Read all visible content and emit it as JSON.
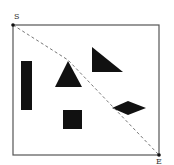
{
  "diagram": {
    "type": "path-planning-obstacle-map",
    "colors": {
      "background": "#ffffff",
      "border": "#555555",
      "obstacle": "#111111",
      "path": "#777777",
      "label": "#333333"
    },
    "start": {
      "label": "S",
      "x": 13,
      "y": 25
    },
    "end": {
      "label": "E",
      "x": 159,
      "y": 155
    },
    "border": {
      "x": 13,
      "y": 25,
      "width": 146,
      "height": 130
    },
    "path_points": [
      [
        13,
        25
      ],
      [
        68,
        60
      ],
      [
        159,
        155
      ]
    ],
    "obstacles": [
      {
        "name": "vertical-bar",
        "shape": "rect",
        "x": 21,
        "y": 61,
        "width": 11,
        "height": 49
      },
      {
        "name": "upright-triangle",
        "shape": "polygon",
        "points": "68,61 55,87 82,87"
      },
      {
        "name": "right-triangle",
        "shape": "polygon",
        "points": "92,47 92,72 123,72"
      },
      {
        "name": "square",
        "shape": "rect",
        "x": 63,
        "y": 110,
        "width": 19,
        "height": 19
      },
      {
        "name": "diamond",
        "shape": "polygon",
        "points": "112,108 128,101 146,108 128,115"
      }
    ]
  }
}
